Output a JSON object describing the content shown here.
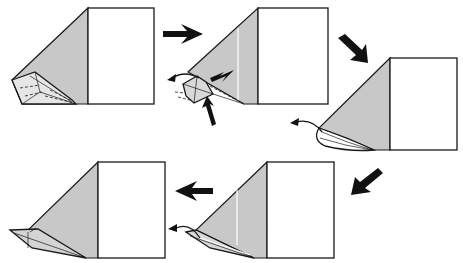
{
  "diagram": {
    "type": "origami-instructions",
    "colors": {
      "paper_front": "#ffffff",
      "paper_back": "#c8c8c8",
      "line": "#1a1a1a",
      "arrow": "#111111"
    },
    "steps": [
      {
        "id": 1,
        "position": "top-left",
        "description": "Rectangle with folded grey triangular flap; narrow pointed tip folded at bottom-left"
      },
      {
        "id": 2,
        "position": "top-middle",
        "description": "Tip being squashed/reverse-folded; push arrows and curved arrow indicating pull out"
      },
      {
        "id": 3,
        "position": "top-right",
        "description": "Rounded layered tip with curved arrow to the left"
      },
      {
        "id": 4,
        "position": "bottom-right",
        "description": "Tip pulled out with curved arrow, white crease line on flap"
      },
      {
        "id": 5,
        "position": "bottom-left",
        "description": "Result: long pointed tip extending left"
      }
    ],
    "arrows": [
      {
        "from": 1,
        "to": 2,
        "direction": "right"
      },
      {
        "from": 2,
        "to": 3,
        "direction": "down-right"
      },
      {
        "from": 3,
        "to": 4,
        "direction": "down-left"
      },
      {
        "from": 4,
        "to": 5,
        "direction": "left"
      }
    ]
  }
}
